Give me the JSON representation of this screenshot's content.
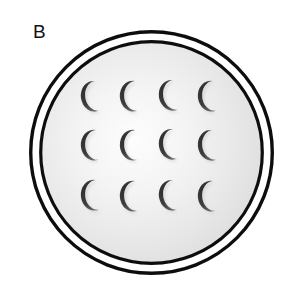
{
  "figure": {
    "panel_label": "B",
    "caption_text": "",
    "background_color": "#ffffff"
  },
  "dish": {
    "name": "petri-dish",
    "outer_ring": {
      "center_x": 151.5,
      "center_y": 152.5,
      "radius": 121.0,
      "stroke_color": "#000000",
      "stroke_width": 3.4,
      "fill_color": "#ffffff"
    },
    "ring_gap": {
      "fill_color": "#ffffff",
      "width": 7.0
    },
    "inner_ring": {
      "center_x": 151.5,
      "center_y": 152.5,
      "radius": 111.0,
      "stroke_color": "#000000",
      "stroke_width": 3.2
    },
    "medium": {
      "name": "agar-medium",
      "fill_center_color": "#fdfdfd",
      "fill_mid_color": "#ececec",
      "fill_edge_color": "#dcdcdc",
      "gradient_center_x_pct": 42,
      "gradient_center_y_pct": 44
    }
  },
  "colony_grid": {
    "name": "crescent-colony-grid",
    "rows": 3,
    "columns": 4,
    "count": 12,
    "shape": "crescent",
    "fill_color": "#3a3a3a",
    "shadow_color": "#8e8e8e",
    "column_centers_x": [
      96,
      135,
      174,
      213
    ],
    "row_centers_y": [
      96,
      145,
      195
    ],
    "crescent_width": 26,
    "crescent_height": 31,
    "items": [
      {
        "row": 1,
        "col": 1,
        "cx": 96,
        "cy": 96,
        "rotation": -8
      },
      {
        "row": 1,
        "col": 2,
        "cx": 135,
        "cy": 96,
        "rotation": -4
      },
      {
        "row": 1,
        "col": 3,
        "cx": 174,
        "cy": 95,
        "rotation": -10
      },
      {
        "row": 1,
        "col": 4,
        "cx": 213,
        "cy": 96,
        "rotation": -6
      },
      {
        "row": 2,
        "col": 1,
        "cx": 96,
        "cy": 145,
        "rotation": -5
      },
      {
        "row": 2,
        "col": 2,
        "cx": 135,
        "cy": 145,
        "rotation": -3
      },
      {
        "row": 2,
        "col": 3,
        "cx": 174,
        "cy": 144,
        "rotation": -9
      },
      {
        "row": 2,
        "col": 4,
        "cx": 213,
        "cy": 145,
        "rotation": -7
      },
      {
        "row": 3,
        "col": 1,
        "cx": 96,
        "cy": 195,
        "rotation": -6
      },
      {
        "row": 3,
        "col": 2,
        "cx": 135,
        "cy": 196,
        "rotation": -4
      },
      {
        "row": 3,
        "col": 3,
        "cx": 174,
        "cy": 195,
        "rotation": -8
      },
      {
        "row": 3,
        "col": 4,
        "cx": 213,
        "cy": 196,
        "rotation": -5
      }
    ]
  }
}
